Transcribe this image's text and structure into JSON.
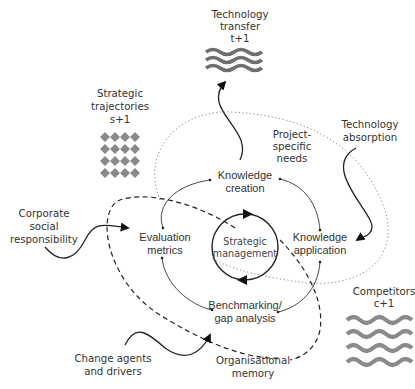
{
  "diagram": {
    "center": {
      "line1": "Strategic",
      "line2": "management"
    },
    "nodes": {
      "knowledge_creation": {
        "line1": "Knowledge",
        "line2": "creation"
      },
      "knowledge_application": {
        "line1": "Knowledge",
        "line2": "application"
      },
      "evaluation_metrics": {
        "line1": "Evaluation",
        "line2": "metrics"
      },
      "benchmarking": {
        "line1": "Benchmarking/",
        "line2": "gap analysis"
      }
    },
    "external": {
      "technology_transfer": {
        "line1": "Technology",
        "line2": "transfer",
        "line3": "t+1"
      },
      "strategic_trajectories": {
        "line1": "Strategic",
        "line2": "trajectories",
        "line3": "s+1"
      },
      "technology_absorption": {
        "line1": "Technology",
        "line2": "absorption"
      },
      "project_specific_needs": {
        "line1": "Project-",
        "line2": "specific",
        "line3": "needs"
      },
      "corporate_social_responsibility": {
        "line1": "Corporate",
        "line2": "social",
        "line3": "responsibility"
      },
      "competitors": {
        "line1": "Competitors",
        "line2": "c+1"
      },
      "change_agents": {
        "line1": "Change agents",
        "line2": "and drivers"
      },
      "organisational_memory": {
        "line1": "Organisational",
        "line2": "memory"
      }
    },
    "colors": {
      "line": "#222222",
      "pattern": "#8a8a8a",
      "pattern_dark": "#6e6e6e",
      "text": "#333333"
    }
  }
}
